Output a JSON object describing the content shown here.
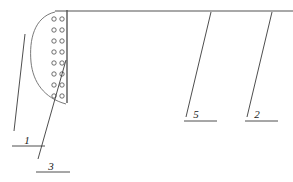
{
  "figure": {
    "width": 293,
    "height": 182,
    "background": "#ffffff",
    "line_color": "#3a3a3a",
    "baseline_color": "#a8a8a8",
    "circle_stroke": "#4a4a4a",
    "circle_fill": "#ffffff",
    "type": "technical-line-drawing"
  },
  "baseline": {
    "name": "top-horizontal-baseline",
    "x1": 55,
    "y1": 11,
    "x2": 293,
    "y2": 11,
    "color": "#a8a8a8",
    "width": 2.2
  },
  "vertical_wall": {
    "name": "vertical-wall-line",
    "x1": 67,
    "y1": 10,
    "x2": 67,
    "y2": 103,
    "color": "#555555",
    "width": 1.4
  },
  "arc": {
    "name": "curved-boundary-arc",
    "path": "M 55,12 C 34,17 29,40 31,62 C 33,82 44,98 66,104",
    "color": "#6a6a6a",
    "width": 0.9
  },
  "circle_rows": {
    "count": 8,
    "radius": 2.2,
    "col_left_x": 54,
    "col_right_x": 62,
    "start_y": 19,
    "spacing": 11
  },
  "callouts": [
    {
      "label": "1",
      "name": "callout-1",
      "leader": {
        "x1": 25,
        "y1": 34,
        "x2": 14,
        "y2": 131
      },
      "underline": {
        "x1": 12,
        "y1": 146,
        "x2": 45,
        "y2": 146
      },
      "text_x": 27,
      "text_y": 144
    },
    {
      "label": "3",
      "name": "callout-3",
      "leader": {
        "x1": 66,
        "y1": 60,
        "x2": 38,
        "y2": 159
      },
      "underline": {
        "x1": 36,
        "y1": 172,
        "x2": 70,
        "y2": 172
      },
      "text_x": 51,
      "text_y": 170
    },
    {
      "label": "5",
      "name": "callout-5",
      "leader": {
        "x1": 211,
        "y1": 12,
        "x2": 186,
        "y2": 117
      },
      "underline": {
        "x1": 184,
        "y1": 121,
        "x2": 217,
        "y2": 121
      },
      "text_x": 196,
      "text_y": 118
    },
    {
      "label": "2",
      "name": "callout-2",
      "leader": {
        "x1": 272,
        "y1": 12,
        "x2": 247,
        "y2": 117
      },
      "underline": {
        "x1": 245,
        "y1": 121,
        "x2": 278,
        "y2": 121
      },
      "text_x": 257,
      "text_y": 118
    }
  ]
}
